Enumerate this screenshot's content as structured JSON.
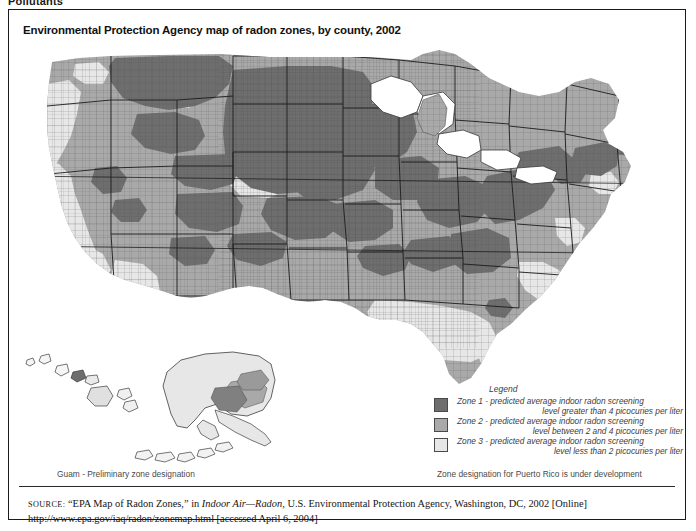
{
  "page": {
    "clipped_heading": "Pollutants"
  },
  "figure": {
    "title": "Environmental Protection Agency map of radon zones, by county, 2002"
  },
  "legend": {
    "title": "Legend",
    "items": [
      {
        "zone": "Zone 1",
        "color": "#6e6e6e",
        "line1": "Zone 1 - predicted average indoor radon screening",
        "line2": "level greater than 4 picocuries per liter"
      },
      {
        "zone": "Zone 2",
        "color": "#a9a9a9",
        "line1": "Zone 2 - predicted average indoor radon screening",
        "line2": "level between 2 and 4 picocuries per liter"
      },
      {
        "zone": "Zone 3",
        "color": "#e7e7e7",
        "line1": "Zone 3 - predicted average indoor radon screening",
        "line2": "level less than 2 picocuries per liter"
      }
    ]
  },
  "notes": {
    "guam": "Guam - Preliminary zone designation",
    "puerto_rico": "Zone designation for Puerto Rico is under development"
  },
  "source": {
    "label": "SOURCE:",
    "quoted_title": "“EPA Map of Radon Zones,”",
    "in_word": "in",
    "publication": "Indoor Air—Radon,",
    "publisher": "U.S. Environmental Protection Agency, Washington, DC, 2002 [Online]",
    "url_line": "http://www.epa.gov/iaq/radon/zonemap.html [accessed April 6, 2004]"
  },
  "map": {
    "alt": "Choropleth map of the United States by county showing EPA radon zone designations, with Alaska and Hawaii insets",
    "colors": {
      "zone1": "#6e6e6e",
      "zone2": "#a9a9a9",
      "zone3": "#e7e7e7",
      "county_line": "#5a5a5a",
      "state_line": "#1c1c1c",
      "background": "#ffffff"
    }
  }
}
